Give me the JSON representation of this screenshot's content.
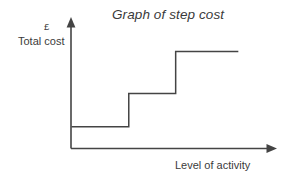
{
  "chart_data": {
    "type": "line",
    "title": "Graph of step cost",
    "xlabel": "Level of activity",
    "ylabel": "Total cost",
    "yunit": "£",
    "grid": false,
    "legend": null,
    "xlim": [
      0,
      100
    ],
    "ylim": [
      0,
      100
    ],
    "annotations": [],
    "series": [
      {
        "name": "Step cost",
        "style": "step-post",
        "color": "#444444",
        "x": [
          0,
          27.6,
          27.6,
          50.2,
          50.2,
          80.4
        ],
        "y": [
          17.7,
          17.7,
          44.6,
          44.6,
          78.5,
          78.5
        ],
        "steps": [
          {
            "level": 1,
            "x_start": 0,
            "x_end": 27.6,
            "y": 17.7
          },
          {
            "level": 2,
            "x_start": 27.6,
            "x_end": 50.2,
            "y": 44.6
          },
          {
            "level": 3,
            "x_start": 50.2,
            "x_end": 80.4,
            "y": 78.5
          }
        ]
      }
    ]
  },
  "axes": {
    "y_arrow": "up-arrow-icon",
    "x_arrow": "right-arrow-icon",
    "line_color": "#444444"
  }
}
